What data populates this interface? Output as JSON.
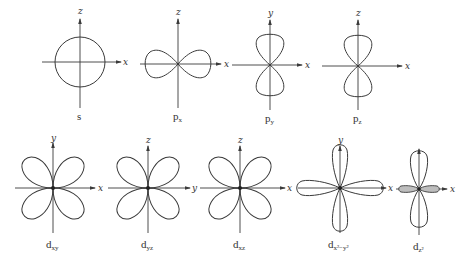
{
  "figure": {
    "background": "#ffffff",
    "line_color": "#3a3a3a"
  },
  "orbitals": [
    {
      "id": "s",
      "label_main": "s",
      "label_sub": "",
      "h_axis": "x",
      "v_axis": "z",
      "shape": "sphere"
    },
    {
      "id": "px",
      "label_main": "p",
      "label_sub": "x",
      "h_axis": "x",
      "v_axis": "z",
      "shape": "two-lobes-horizontal"
    },
    {
      "id": "py",
      "label_main": "p",
      "label_sub": "y",
      "h_axis": "x",
      "v_axis": "y",
      "shape": "two-lobes-vertical"
    },
    {
      "id": "pz",
      "label_main": "p",
      "label_sub": "z",
      "h_axis": "x",
      "v_axis": "z",
      "shape": "two-lobes-vertical"
    },
    {
      "id": "dxy",
      "label_main": "d",
      "label_sub": "xy",
      "h_axis": "x",
      "v_axis": "y",
      "shape": "four-lobes-diagonal"
    },
    {
      "id": "dyz",
      "label_main": "d",
      "label_sub": "yz",
      "h_axis": "y",
      "v_axis": "z",
      "shape": "four-lobes-diagonal"
    },
    {
      "id": "dxz",
      "label_main": "d",
      "label_sub": "xz",
      "h_axis": "x",
      "v_axis": "z",
      "shape": "four-lobes-diagonal"
    },
    {
      "id": "dx2y2",
      "label_main": "d",
      "label_sub": "x²−y²",
      "h_axis": "x",
      "v_axis": "y",
      "shape": "four-lobes-on-axes"
    },
    {
      "id": "dz2",
      "label_main": "d",
      "label_sub": "z²",
      "h_axis": "x",
      "v_axis": "",
      "shape": "two-lobes-vertical-with-torus"
    }
  ]
}
